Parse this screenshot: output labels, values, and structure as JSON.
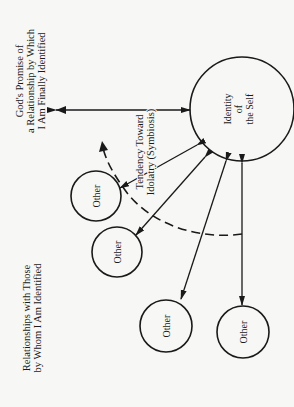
{
  "diagram": {
    "type": "relationship-diagram",
    "orientation": "rotated-90-ccw",
    "colors": {
      "ink": "#1a1a1a",
      "paper": "#f7f7f5"
    },
    "self_node": {
      "label_lines": [
        "Identity",
        "of",
        "the Self"
      ]
    },
    "other_nodes": [
      {
        "label": "Other"
      },
      {
        "label": "Other"
      },
      {
        "label": "Other"
      },
      {
        "label": "Other"
      }
    ],
    "gods_promise": {
      "lines": [
        "God's Promise of",
        "a Relationship by Which",
        "I Am Finally Identified"
      ]
    },
    "tendency": {
      "lines": [
        "Tendency Toward",
        "Idolatry (Symbiosis)"
      ]
    },
    "relationships": {
      "lines": [
        "Relationships with Those",
        "by Whom I Am Identified"
      ]
    },
    "edges": [
      {
        "from": "God",
        "to": "Identity of the Self",
        "style": "double-arrow"
      },
      {
        "from": "Identity of the Self",
        "to": "Other 1",
        "style": "double-arrow"
      },
      {
        "from": "Identity of the Self",
        "to": "Other 2",
        "style": "double-arrow"
      },
      {
        "from": "Identity of the Self",
        "to": "Other 3",
        "style": "double-arrow"
      },
      {
        "from": "Identity of the Self",
        "to": "Other 4",
        "style": "double-arrow"
      },
      {
        "from": "boundary",
        "to": "Tendency Toward Idolatry",
        "style": "dashed-arc-arrow"
      }
    ]
  }
}
